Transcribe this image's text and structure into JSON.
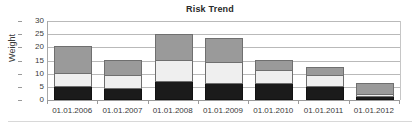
{
  "chart_data": {
    "type": "bar",
    "subtype": "stacked-bar",
    "title": "Risk Trend",
    "xlabel": "",
    "ylabel": "Weight",
    "ylim": [
      0,
      30
    ],
    "ytick_step": 5,
    "yticks": [
      30,
      25,
      20,
      15,
      10,
      5,
      0
    ],
    "grid": true,
    "legend": "none",
    "categories": [
      "01.01.2006",
      "01.01.2007",
      "01.01.2008",
      "01.01.2009",
      "01.01.2010",
      "01.01.2011",
      "01.01.2012"
    ],
    "series": [
      {
        "name": "low",
        "color": "#1b1b1b",
        "values": [
          5,
          4,
          7,
          6,
          6,
          5,
          1
        ]
      },
      {
        "name": "medium",
        "color": "#efefef",
        "values": [
          5,
          5,
          8,
          8,
          5,
          4,
          1
        ]
      },
      {
        "name": "high",
        "color": "#9a9a9a",
        "values": [
          10,
          6,
          9.5,
          9,
          4,
          3,
          4
        ]
      }
    ],
    "totals": [
      20,
      15,
      24.5,
      23,
      15,
      12,
      6
    ]
  },
  "colors": {
    "segment_high": "#9a9a9a",
    "segment_medium": "#efefef",
    "segment_low": "#1b1b1b",
    "gridline": "#b9b9b9",
    "axis": "#9a9a9a",
    "text": "#3a3a3a",
    "title": "#2a2a2a",
    "background": "#ffffff"
  }
}
